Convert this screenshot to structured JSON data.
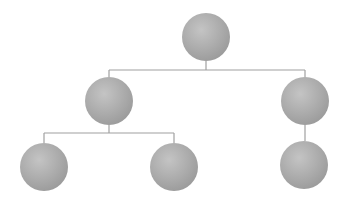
{
  "diagram": {
    "type": "tree",
    "width": 349,
    "height": 210,
    "colors": {
      "background": "#ffffff",
      "node_fill": "#ababab",
      "node_highlight": "#c4c4c4",
      "node_shadow": "#9a9a9a",
      "connector": "#a0a0a0"
    },
    "node_radius": 24,
    "nodes": [
      {
        "id": "root",
        "cx": 206,
        "cy": 37,
        "parent": null
      },
      {
        "id": "mid-left",
        "cx": 109,
        "cy": 101,
        "parent": "root"
      },
      {
        "id": "mid-right",
        "cx": 305,
        "cy": 101,
        "parent": "root"
      },
      {
        "id": "leaf-left",
        "cx": 44,
        "cy": 167,
        "parent": "mid-left"
      },
      {
        "id": "leaf-middle",
        "cx": 174,
        "cy": 167,
        "parent": "mid-left"
      },
      {
        "id": "leaf-right",
        "cx": 304,
        "cy": 165,
        "parent": "mid-right"
      }
    ],
    "connectors": [
      {
        "id": "root-stem",
        "x1": 206,
        "y1": 61,
        "x2": 206,
        "y2": 70
      },
      {
        "id": "level1-bar",
        "x1": 109,
        "y1": 70,
        "x2": 305,
        "y2": 70
      },
      {
        "id": "mid-left-drop",
        "x1": 109,
        "y1": 70,
        "x2": 109,
        "y2": 77
      },
      {
        "id": "mid-right-drop",
        "x1": 305,
        "y1": 70,
        "x2": 305,
        "y2": 77
      },
      {
        "id": "mid-left-stem",
        "x1": 109,
        "y1": 125,
        "x2": 109,
        "y2": 133
      },
      {
        "id": "level2-left-bar",
        "x1": 44,
        "y1": 133,
        "x2": 174,
        "y2": 133
      },
      {
        "id": "leaf-left-drop",
        "x1": 44,
        "y1": 133,
        "x2": 44,
        "y2": 143
      },
      {
        "id": "leaf-middle-drop",
        "x1": 174,
        "y1": 133,
        "x2": 174,
        "y2": 143
      },
      {
        "id": "mid-right-to-leaf",
        "x1": 305,
        "y1": 125,
        "x2": 305,
        "y2": 141
      }
    ]
  }
}
